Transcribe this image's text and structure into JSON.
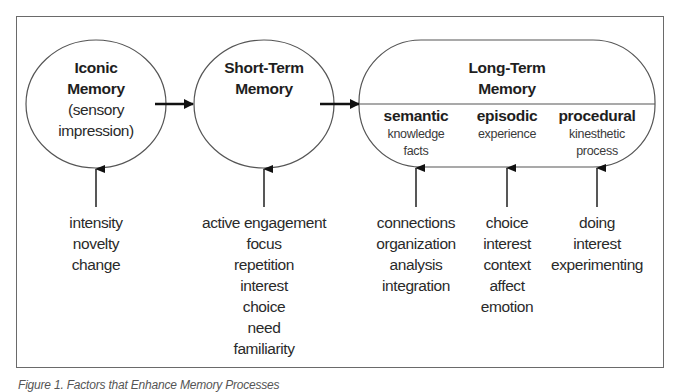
{
  "figure": {
    "caption": "Figure 1. Factors that Enhance Memory Processes"
  },
  "nodes": {
    "iconic": {
      "title_line1": "Iconic",
      "title_line2": "Memory",
      "sub_line1": "(sensory",
      "sub_line2": "impression)"
    },
    "short_term": {
      "title_line1": "Short-Term",
      "title_line2": "Memory"
    },
    "long_term": {
      "title_line1": "Long-Term",
      "title_line2": "Memory",
      "categories": [
        {
          "name": "semantic",
          "sub_line1": "knowledge",
          "sub_line2": "facts"
        },
        {
          "name": "episodic",
          "sub_line1": "experience",
          "sub_line2": ""
        },
        {
          "name": "procedural",
          "sub_line1": "kinesthetic",
          "sub_line2": "process"
        }
      ]
    }
  },
  "factors": {
    "iconic": [
      "intensity",
      "novelty",
      "change"
    ],
    "short_term": [
      "active engagement",
      "focus",
      "repetition",
      "interest",
      "choice",
      "need",
      "familiarity"
    ],
    "semantic": [
      "connections",
      "organization",
      "analysis",
      "integration"
    ],
    "episodic": [
      "choice",
      "interest",
      "context",
      "affect",
      "emotion"
    ],
    "procedural": [
      "doing",
      "interest",
      "experimenting"
    ]
  },
  "colors": {
    "stroke": "#555555",
    "arrow": "#111111",
    "text": "#1e1e1e"
  }
}
